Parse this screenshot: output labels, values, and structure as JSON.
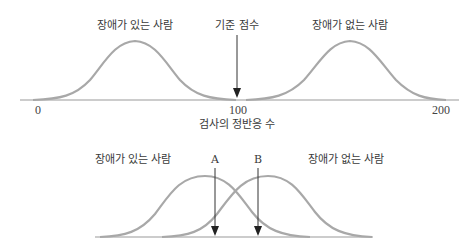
{
  "top": {
    "label_disabled": "장애가 있는 사람",
    "label_cutoff": "기준 점수",
    "label_nondisabled": "장애가 없는 사람",
    "tick_0": "0",
    "tick_100": "100",
    "tick_200": "200",
    "xlabel": "검사의 정반응 수"
  },
  "bottom": {
    "label_disabled": "장애가 있는 사람",
    "label_a": "A",
    "label_b": "B",
    "label_nondisabled": "장애가 없는 사람"
  },
  "colors": {
    "curve": "#a8a8a8",
    "axis": "#9a9a9a",
    "arrow": "#333333"
  }
}
